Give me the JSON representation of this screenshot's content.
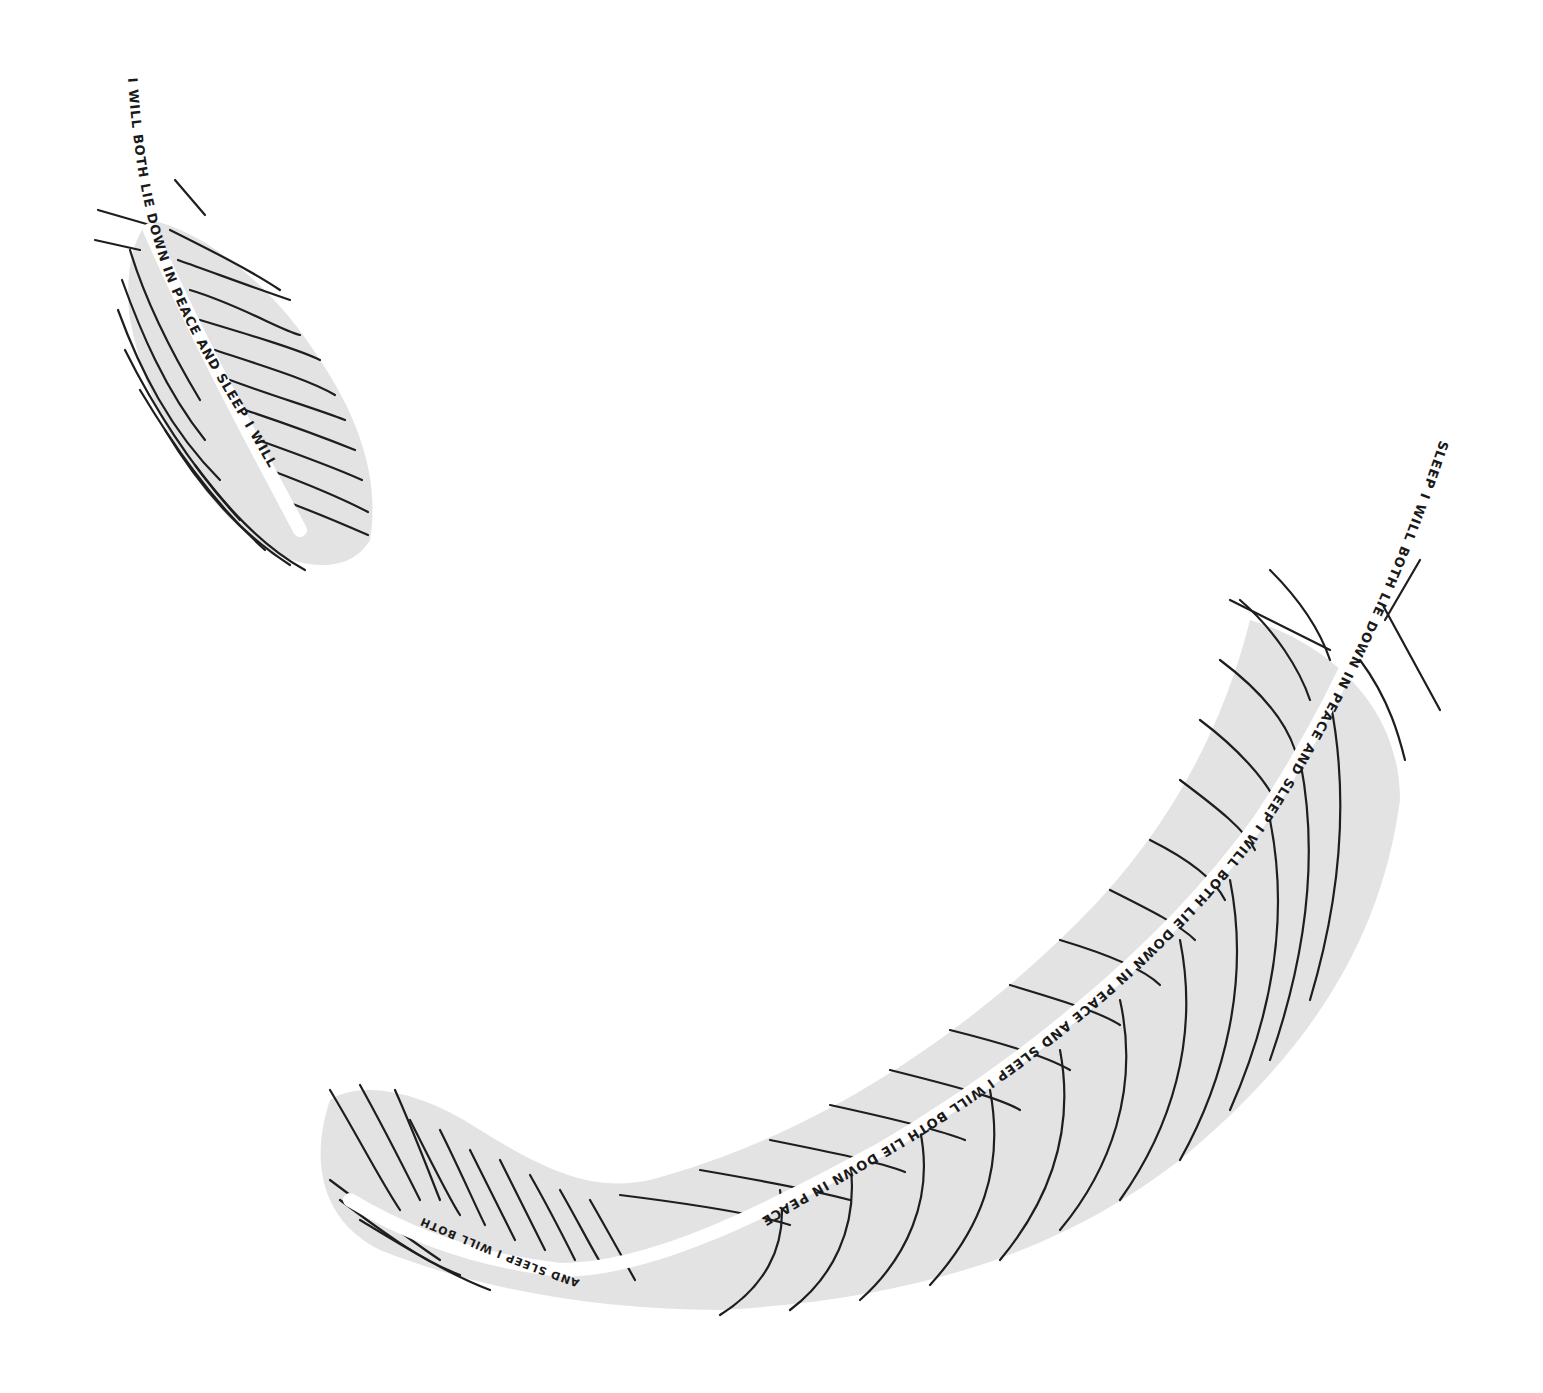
{
  "illustration": {
    "description": "Pencil and ink drawing of two feathers with handwritten text along the quills",
    "colors": {
      "background": "#ffffff",
      "ink": "#1e1e1e",
      "shading": "#d9d9d9"
    },
    "small_feather": {
      "quill_text": "I WILL BOTH LIE DOWN IN PEACE AND SLEEP I WILL"
    },
    "large_feather": {
      "quill_text_top": "SLEEP I WILL BOTH LIE DOWN IN PEACE AND SLEEP I WILL BOTH LIE DOWN IN PEACE AND SLEEP I WILL BOTH LIE DOWN IN PEACE",
      "tip_text": "AND SLEEP I WILL BOTH"
    }
  }
}
